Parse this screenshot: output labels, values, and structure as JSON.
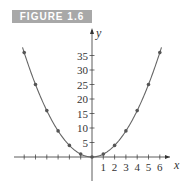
{
  "figure": {
    "label": "FIGURE 1.6"
  },
  "chart_data": {
    "type": "line",
    "title": "",
    "xlabel": "x",
    "ylabel": "y",
    "x": [
      -6,
      -5,
      -4,
      -3,
      -2,
      -1,
      0,
      1,
      2,
      3,
      4,
      5,
      6
    ],
    "series": [
      {
        "name": "y = x^2",
        "values": [
          36,
          25,
          16,
          9,
          4,
          1,
          0,
          1,
          4,
          9,
          16,
          25,
          36
        ],
        "markers": true
      }
    ],
    "x_tick_labels": [
      "1",
      "2",
      "3",
      "4",
      "5",
      "6"
    ],
    "y_tick_labels": [
      "5",
      "10",
      "15",
      "20",
      "25",
      "30",
      "35"
    ],
    "xlim": [
      -6.5,
      7
    ],
    "ylim": [
      -2,
      40
    ],
    "grid": false,
    "legend": "none",
    "colors": {
      "curve": "#666666",
      "axis": "#333333",
      "header_bg": "#a8a8a8"
    }
  }
}
